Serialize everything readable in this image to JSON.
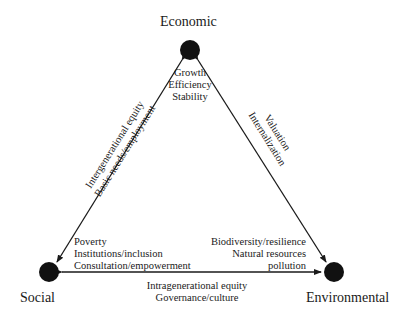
{
  "nodes": {
    "economic": {
      "label": "Economic"
    },
    "social": {
      "label": "Social"
    },
    "environmental": {
      "label": "Environmental"
    }
  },
  "economic_notes": [
    "Growth",
    "Efficiency",
    "Stability"
  ],
  "social_notes": [
    "Poverty",
    "Institutions/inclusion",
    "Consultation/empowerment"
  ],
  "environmental_notes": [
    "Biodiversity/resilience",
    "Natural resources",
    "pollution"
  ],
  "edges": {
    "economic_social": [
      "Intergenerational equity",
      "Basic needs/employment"
    ],
    "economic_environmental": [
      "Valuation",
      "Internalization"
    ],
    "social_environmental": [
      "Intragenerational equity",
      "Governance/culture"
    ]
  },
  "colors": {
    "ink": "#1a1a1a",
    "background": "#ffffff"
  }
}
